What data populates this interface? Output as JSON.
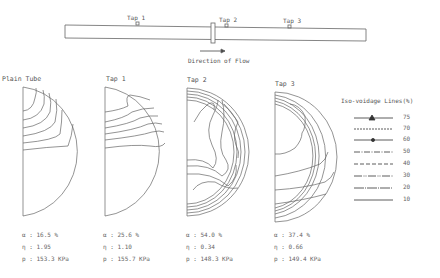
{
  "pipe": {
    "taps": [
      {
        "label": "Tap 1"
      },
      {
        "label": "Tap 2"
      },
      {
        "label": "Tap 3"
      }
    ],
    "flow_label": "Direction of Flow"
  },
  "panels": [
    {
      "title": "Plain Tube",
      "alpha": "α : 16.5  %",
      "eta": "η : 1.95",
      "p": "p : 153.3 KPa"
    },
    {
      "title": "Tap 1",
      "alpha": "α : 25.6  %",
      "eta": "η : 1.10",
      "p": "p : 155.7 KPa"
    },
    {
      "title": "Tap 2",
      "alpha": "α : 54.0  %",
      "eta": "η : 0.34",
      "p": "p : 148.3 KPa"
    },
    {
      "title": "Tap 3",
      "alpha": "α : 37.4  %",
      "eta": "η : 0.66",
      "p": "p : 149.4 KPa"
    }
  ],
  "legend": {
    "title": "Iso-voidage Lines(%)",
    "items": [
      {
        "value": "75",
        "style": "solid-triangle"
      },
      {
        "value": "70",
        "style": "dashed-fine"
      },
      {
        "value": "60",
        "style": "solid-dot"
      },
      {
        "value": "50",
        "style": "dash-dot"
      },
      {
        "value": "40",
        "style": "dashed"
      },
      {
        "value": "30",
        "style": "dash-dot-dot"
      },
      {
        "value": "20",
        "style": "dash-dot-fine"
      },
      {
        "value": "10",
        "style": "solid"
      }
    ]
  }
}
